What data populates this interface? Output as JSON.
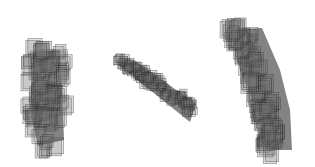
{
  "scene": {
    "description": "Three translucent voxel-rendered 3D shapes on white background",
    "objects": [
      {
        "name": "vertical-blob",
        "orientation": "vertical"
      },
      {
        "name": "diagonal-bar",
        "orientation": "diagonal"
      },
      {
        "name": "curved-column",
        "orientation": "curved"
      }
    ]
  }
}
